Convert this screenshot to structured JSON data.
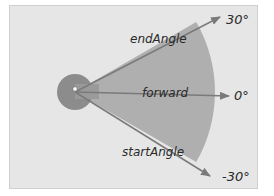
{
  "diagram": {
    "labels": {
      "end_angle": "endAngle",
      "forward": "forward",
      "start_angle": "startAngle"
    },
    "angles": {
      "top": "30°",
      "middle": "0°",
      "bottom": "-30°"
    },
    "colors": {
      "panel_bg": "#e6e6e6",
      "wedge_fill": "#a8a8a8",
      "origin_circle": "#8c8c8c",
      "arrow": "#7a7a7a",
      "text": "#2a2a2a"
    }
  }
}
